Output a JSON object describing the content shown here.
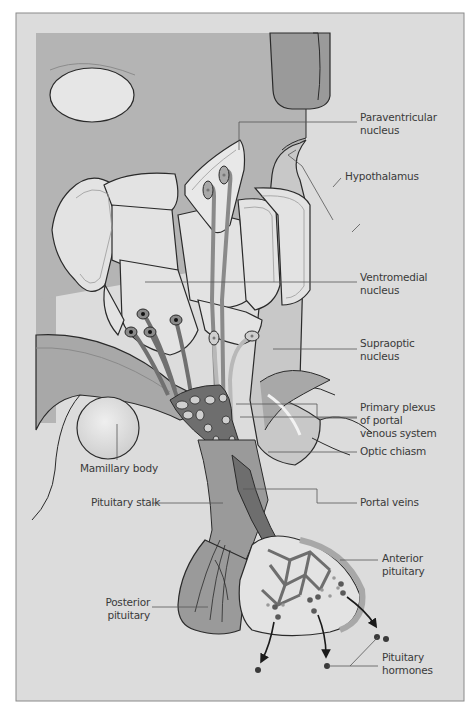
{
  "figure": {
    "colors": {
      "frame_bg": "#dcdcdc",
      "frame_border": "#8a8a8a",
      "panel_bg": "#b4b4b4",
      "tissue_light": "#e6e6e6",
      "tissue_mid": "#c8c8c8",
      "vessel_dark": "#6e6e6e",
      "outline": "#2a2a2a",
      "leader": "#555555",
      "label_text": "#3a3a3a"
    },
    "labels": {
      "paraventricular": "Paraventricular\nnucleus",
      "hypothalamus": "Hypothalamus",
      "ventromedial": "Ventromedial\nnucleus",
      "supraoptic": "Supraoptic\nnucleus",
      "primary_plexus": "Primary plexus\nof portal\nvenous system",
      "optic_chiasm": "Optic chiasm",
      "mamillary_body": "Mamillary body",
      "pituitary_stalk": "Pituitary stalk",
      "portal_veins": "Portal veins",
      "anterior_pituitary": "Anterior\npituitary",
      "posterior_pituitary": "Posterior\npituitary",
      "pituitary_hormones": "Pituitary\nhormones"
    }
  }
}
